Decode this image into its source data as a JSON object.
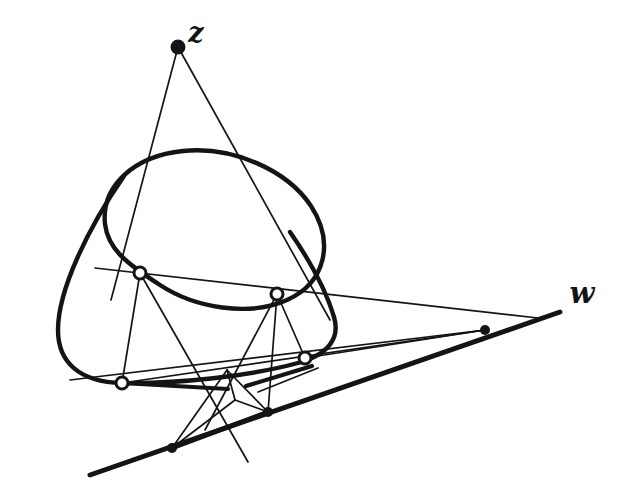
{
  "figure": {
    "background_color": "#ffffff",
    "ink_color": "#141414",
    "width": 641,
    "height": 501
  },
  "labels": [
    {
      "name": "label-z",
      "text": "z",
      "x": 196,
      "y": 42,
      "font_size": 27,
      "describes": "apex point of the tangent pencil"
    },
    {
      "name": "label-w",
      "text": "w",
      "x": 582,
      "y": 303,
      "font_size": 29,
      "describes": "the base line running lower-left to upper-right"
    }
  ],
  "points": {
    "filled": [
      {
        "name": "point-z-apex",
        "x": 178,
        "y": 47,
        "r": 7.5
      },
      {
        "name": "point-w-right",
        "x": 485,
        "y": 330,
        "r": 5.0
      },
      {
        "name": "point-w-mid",
        "x": 268,
        "y": 412,
        "r": 5.0
      },
      {
        "name": "point-w-left",
        "x": 172,
        "y": 448,
        "r": 5.0
      }
    ],
    "open": [
      {
        "name": "point-tangency-upper-left",
        "x": 140,
        "y": 273,
        "r": 6.0
      },
      {
        "name": "point-tangency-upper-right",
        "x": 277,
        "y": 294,
        "r": 6.0
      },
      {
        "name": "point-tangency-lower-left",
        "x": 122,
        "y": 383,
        "r": 6.0
      },
      {
        "name": "point-tangency-lower-right",
        "x": 305,
        "y": 358,
        "r": 6.0
      }
    ]
  },
  "conics": [
    {
      "name": "conic-ellipse-inner",
      "stroke_width": 4.4,
      "path": "M 105 224 C 101 186 134 156 183 151 C 233 146 287 170 311 206 C 335 243 325 283 287 300 C 249 317 195 308 160 285 C 126 263 108 249 105 224 Z"
    },
    {
      "name": "conic-outer-cone",
      "stroke_width": 4.4,
      "path": "M 124 176 C 88 228 58 290 58 330 C 58 362 79 382 122 383 C 178 384 250 376 298 363 C 330 354 340 337 334 317 C 326 290 308 258 290 232"
    }
  ],
  "thin_lines": [
    {
      "name": "tangent-line-z-left",
      "x1": 178,
      "y1": 47,
      "x2": 111,
      "y2": 300
    },
    {
      "name": "tangent-line-z-right",
      "x1": 178,
      "y1": 47,
      "x2": 330,
      "y2": 320
    },
    {
      "name": "chord-upper-tangency",
      "x1": 95,
      "y1": 268,
      "x2": 538,
      "y2": 318
    },
    {
      "name": "chord-lower-tangency",
      "x1": 70,
      "y1": 380,
      "x2": 485,
      "y2": 330
    },
    {
      "name": "segment-left-vertical",
      "x1": 140,
      "y1": 273,
      "x2": 122,
      "y2": 383
    },
    {
      "name": "segment-right-vertical",
      "x1": 277,
      "y1": 294,
      "x2": 305,
      "y2": 358
    },
    {
      "name": "segment-ul-to-cross",
      "x1": 140,
      "y1": 273,
      "x2": 248,
      "y2": 462
    },
    {
      "name": "segment-ur-to-cross",
      "x1": 277,
      "y1": 294,
      "x2": 205,
      "y2": 430
    },
    {
      "name": "segment-ur-to-wmid",
      "x1": 277,
      "y1": 294,
      "x2": 268,
      "y2": 412
    },
    {
      "name": "segment-cross-to-wleft",
      "x1": 227,
      "y1": 370,
      "x2": 172,
      "y2": 448
    },
    {
      "name": "segment-cross-to-wmid",
      "x1": 227,
      "y1": 370,
      "x2": 268,
      "y2": 412
    },
    {
      "name": "segment-inner-apex-down",
      "x1": 227,
      "y1": 370,
      "x2": 235,
      "y2": 400
    },
    {
      "name": "segment-inner-to-wmid",
      "x1": 235,
      "y1": 400,
      "x2": 268,
      "y2": 412
    },
    {
      "name": "segment-inner-to-wleft",
      "x1": 235,
      "y1": 400,
      "x2": 172,
      "y2": 448
    },
    {
      "name": "segment-lowleft-to-wright",
      "x1": 122,
      "y1": 383,
      "x2": 485,
      "y2": 330
    },
    {
      "name": "segment-lowright-to-wright",
      "x1": 305,
      "y1": 358,
      "x2": 485,
      "y2": 330
    },
    {
      "name": "segment-spur-right",
      "x1": 258,
      "y1": 392,
      "x2": 318,
      "y2": 368
    }
  ],
  "thick_lines": [
    {
      "name": "line-w-base",
      "x1": 90,
      "y1": 475,
      "x2": 560,
      "y2": 312,
      "stroke_width": 5.0
    },
    {
      "name": "segment-w-chord",
      "x1": 172,
      "y1": 448,
      "x2": 268,
      "y2": 412,
      "stroke_width": 4.6
    },
    {
      "name": "segment-left-short",
      "x1": 122,
      "y1": 383,
      "x2": 228,
      "y2": 389,
      "stroke_width": 4.2
    },
    {
      "name": "segment-mid-short",
      "x1": 246,
      "y1": 386,
      "x2": 312,
      "y2": 366,
      "stroke_width": 4.2
    }
  ]
}
